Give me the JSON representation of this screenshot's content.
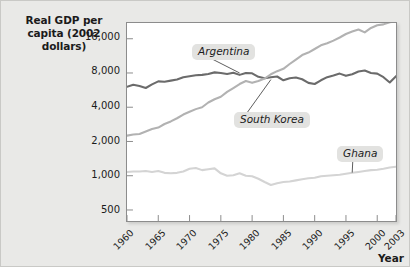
{
  "figure": {
    "y_axis_title": "Real GDP per capita (2002 dollars)",
    "x_axis_title": "Year"
  },
  "labels": {
    "argentina": "Argentina",
    "south_korea": "South Korea",
    "ghana": "Ghana"
  },
  "colors": {
    "argentina": "#6b6b6b",
    "south_korea": "#b2b2b2",
    "ghana": "#d4d4d4",
    "axis": "#8c8c8c",
    "plot_background": "#ffffff",
    "figure_background": "#e9e9e7",
    "label_background": "#e2e2e0",
    "text": "#1b1b1b"
  },
  "chart_data": {
    "type": "line",
    "title": "Real GDP per capita (2002 dollars)",
    "xlabel": "Year",
    "ylabel": "Real GDP per capita (2002 dollars)",
    "yscale": "log",
    "ylim": [
      400,
      22000
    ],
    "xlim": [
      1960,
      2003
    ],
    "grid": false,
    "legend": "inline-callout-labels",
    "ytick_labels": [
      "16,000",
      "8,000",
      "4,000",
      "2,000",
      "1,000",
      "500"
    ],
    "ytick_values": [
      16000,
      8000,
      4000,
      2000,
      1000,
      500
    ],
    "xtick_labels": [
      "1960",
      "1965",
      "1970",
      "1975",
      "1980",
      "1985",
      "1990",
      "1995",
      "2000",
      "2003"
    ],
    "xtick_values": [
      1960,
      1965,
      1970,
      1975,
      1980,
      1985,
      1990,
      1995,
      2000,
      2003
    ],
    "x": [
      1960,
      1961,
      1962,
      1963,
      1964,
      1965,
      1966,
      1967,
      1968,
      1969,
      1970,
      1971,
      1972,
      1973,
      1974,
      1975,
      1976,
      1977,
      1978,
      1979,
      1980,
      1981,
      1982,
      1983,
      1984,
      1985,
      1986,
      1987,
      1988,
      1989,
      1990,
      1991,
      1992,
      1993,
      1994,
      1995,
      1996,
      1997,
      1998,
      1999,
      2000,
      2001,
      2002,
      2003
    ],
    "series": [
      {
        "name": "Argentina",
        "color": "#6b6b6b",
        "values": [
          6050,
          6300,
          6150,
          5900,
          6350,
          6750,
          6700,
          6850,
          7000,
          7350,
          7500,
          7650,
          7700,
          7850,
          8100,
          8000,
          7850,
          8050,
          7700,
          8000,
          7950,
          7400,
          7200,
          7350,
          7450,
          6900,
          7200,
          7300,
          7050,
          6550,
          6400,
          6900,
          7350,
          7600,
          7900,
          7550,
          7800,
          8250,
          8400,
          8000,
          7900,
          7350,
          6600,
          7500
        ]
      },
      {
        "name": "South Korea",
        "color": "#b2b2b2",
        "values": [
          2250,
          2300,
          2330,
          2450,
          2570,
          2650,
          2850,
          3000,
          3200,
          3450,
          3650,
          3850,
          4000,
          4400,
          4700,
          4950,
          5450,
          5900,
          6400,
          6800,
          6550,
          6800,
          7150,
          7800,
          8300,
          8700,
          9600,
          10500,
          11500,
          12100,
          13000,
          14000,
          14600,
          15400,
          16400,
          17600,
          18500,
          19300,
          18200,
          19900,
          21000,
          21400,
          22300,
          22800
        ]
      },
      {
        "name": "Ghana",
        "color": "#d4d4d4",
        "values": [
          1080,
          1090,
          1090,
          1100,
          1080,
          1100,
          1060,
          1050,
          1060,
          1090,
          1150,
          1170,
          1120,
          1140,
          1160,
          1050,
          1000,
          1010,
          1050,
          1000,
          990,
          940,
          880,
          830,
          860,
          880,
          890,
          910,
          930,
          950,
          960,
          990,
          1000,
          1010,
          1020,
          1040,
          1060,
          1080,
          1100,
          1120,
          1130,
          1150,
          1180,
          1200
        ]
      }
    ],
    "annotations": [
      {
        "text": "Argentina",
        "points_to_year": 1978,
        "points_to_value": 8000
      },
      {
        "text": "South Korea",
        "points_to_year": 1983,
        "points_to_value": 7000
      },
      {
        "text": "Ghana",
        "points_to_year": 1996,
        "points_to_value": 1065
      }
    ]
  }
}
